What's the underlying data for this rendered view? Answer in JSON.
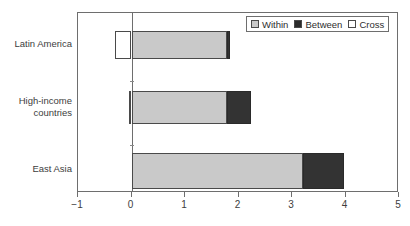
{
  "chart_data": {
    "type": "bar",
    "orientation": "horizontal",
    "stacked": true,
    "title": "",
    "xlabel": "",
    "ylabel": "",
    "xlim": [
      -1,
      5
    ],
    "xticks": [
      -1,
      0,
      1,
      2,
      3,
      4,
      5
    ],
    "xtick_labels": [
      "−1",
      "0",
      "1",
      "2",
      "3",
      "4",
      "5"
    ],
    "grid": false,
    "legend_position": "top-right",
    "categories": [
      "Latin America",
      "High-income countries",
      "East Asia"
    ],
    "series": [
      {
        "name": "Within",
        "color": "#c9c9c9",
        "values": [
          1.78,
          1.78,
          3.2
        ]
      },
      {
        "name": "Between",
        "color": "#2b2b2b",
        "values": [
          0.07,
          0.46,
          0.78
        ]
      },
      {
        "name": "Cross",
        "color": "#ffffff",
        "values": [
          -0.3,
          -0.04,
          0.0
        ]
      }
    ],
    "totals": [
      1.55,
      2.2,
      3.98
    ]
  },
  "legend": {
    "items": [
      {
        "label": "Within",
        "swatch": "light-gray-swatch"
      },
      {
        "label": "Between",
        "swatch": "dark-swatch"
      },
      {
        "label": "Cross",
        "swatch": "white-swatch"
      }
    ]
  },
  "axis": {
    "x_tick_labels": [
      "−1",
      "0",
      "1",
      "2",
      "3",
      "4",
      "5"
    ]
  },
  "categories": {
    "latin_america": "Latin America",
    "high_income_line1": "High-income",
    "high_income_line2": "countries",
    "east_asia": "East Asia"
  }
}
